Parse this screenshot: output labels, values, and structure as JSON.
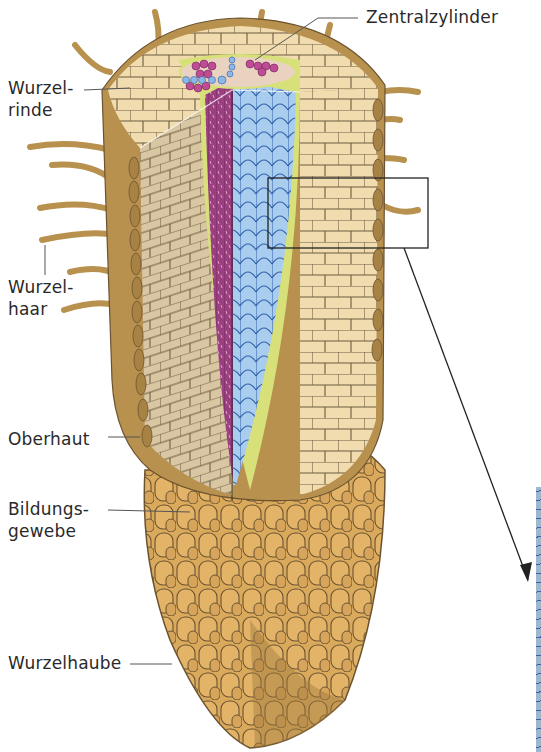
{
  "figure": {
    "labels": {
      "zentralzylinder": "Zentralzylinder",
      "wurzelrinde": "Wurzel-\nrinde",
      "wurzelhaar": "Wurzel-\nhaar",
      "oberhaut": "Oberhaut",
      "bildungsgewebe": "Bildungs-\ngewebe",
      "wurzelhaube": "Wurzelhaube"
    },
    "colors": {
      "cortex": "#f1dcb0",
      "cortex_shade": "#d9c6a3",
      "epidermis": "#b8914f",
      "root_cap": "#d9a95c",
      "phloem": "#9a3f80",
      "xylem": "#a9cdee",
      "endodermis": "#d8e07a",
      "cell_line": "#6b5a3e",
      "arrow": "#222222",
      "detail_strip": "#9fb6cf"
    }
  }
}
